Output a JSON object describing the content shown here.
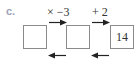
{
  "problem": {
    "part_label": "c.",
    "operations": [
      {
        "label": "× −3",
        "direction": "forward"
      },
      {
        "label": "+ 2",
        "direction": "forward"
      }
    ],
    "boxes": [
      {
        "value": ""
      },
      {
        "value": ""
      },
      {
        "value": "14"
      }
    ],
    "reverse_arrows": 2
  },
  "colors": {
    "label": "#9aa3b5",
    "text": "#333333",
    "box_border": "#8a8a8a",
    "arrow": "#222222"
  }
}
